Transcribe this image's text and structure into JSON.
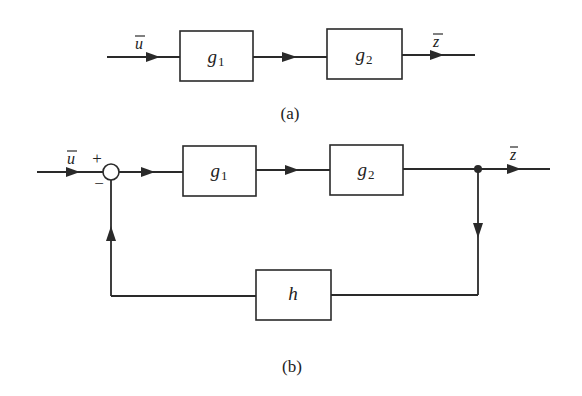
{
  "diagram_a": {
    "caption": "(a)",
    "input_label": "u",
    "output_label": "z",
    "blocks": [
      {
        "symbol": "g",
        "subscript": "1"
      },
      {
        "symbol": "g",
        "subscript": "2"
      }
    ]
  },
  "diagram_b": {
    "caption": "(b)",
    "input_label": "u",
    "output_label": "z",
    "summing_junction": {
      "plus_sign": "+",
      "minus_sign": "−"
    },
    "blocks": [
      {
        "symbol": "g",
        "subscript": "1"
      },
      {
        "symbol": "g",
        "subscript": "2"
      }
    ],
    "feedback_block": {
      "symbol": "h"
    }
  }
}
